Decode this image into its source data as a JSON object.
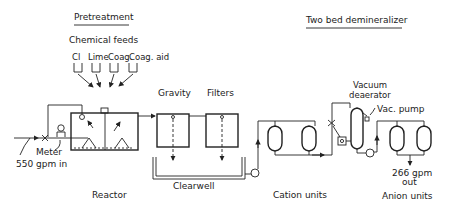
{
  "sections": {
    "pretreatment": "Pretreatment",
    "demineralizer": "Two bed demineralizer"
  },
  "chemical_feeds": {
    "title": "Chemical feeds",
    "items": [
      "Cl",
      "Lime",
      "Coag.",
      "Coag. aid"
    ]
  },
  "labels": {
    "gravity": "Gravity",
    "filters": "Filters",
    "vacuum": "Vacuum",
    "deaerator": "deaerator",
    "vac_pump": "Vac. pump",
    "meter": "Meter",
    "inflow": "550 gpm in",
    "reactor": "Reactor",
    "clearwell": "Clearwell",
    "cation_units": "Cation units",
    "anion_units": "Anion units",
    "outflow_1": "266 gpm",
    "outflow_2": "out"
  }
}
